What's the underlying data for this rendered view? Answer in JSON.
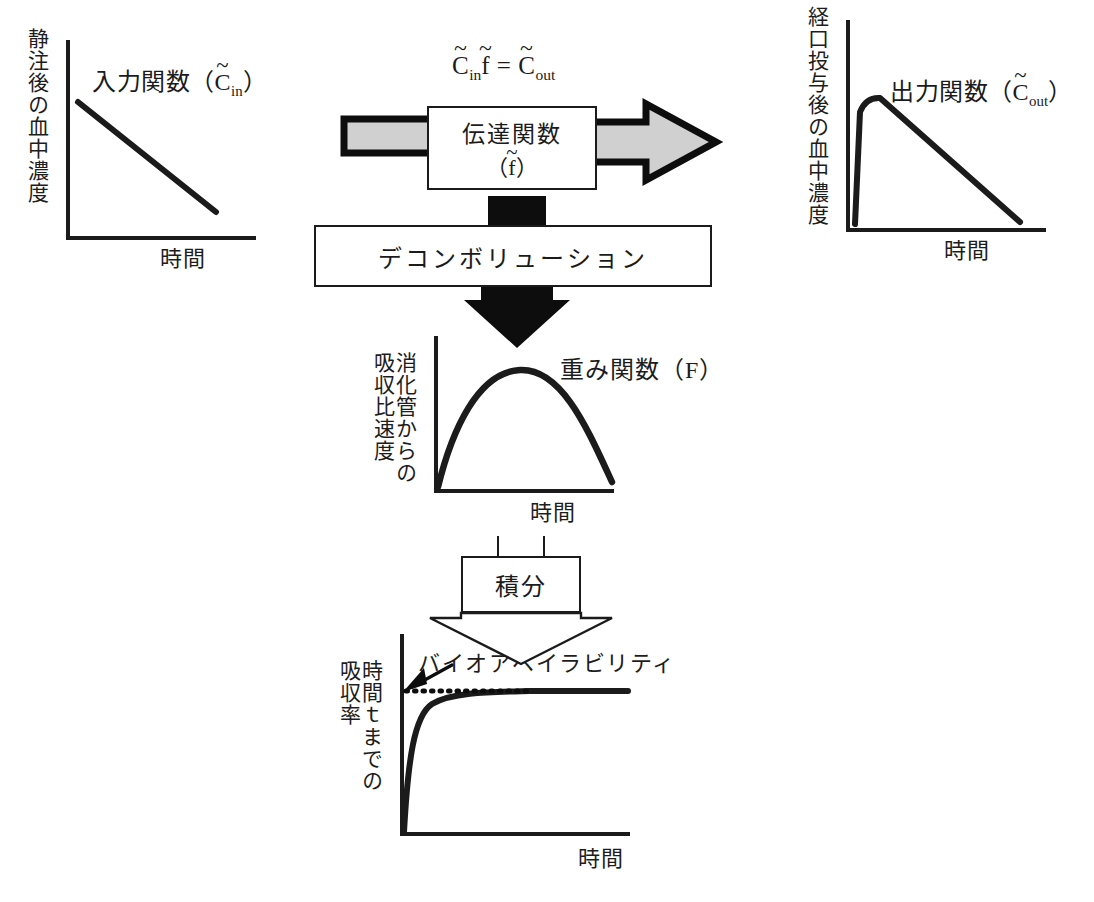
{
  "diagram": {
    "colors": {
      "line": "#1b1b1b",
      "arrow_fill": "#d0d0d0",
      "arrow_outline": "#0d0d0d",
      "block_fill": "#0d0d0d",
      "background": "#ffffff"
    }
  },
  "charts": {
    "input_function": {
      "ylabel": "静注後の血中濃度",
      "xlabel": "時間",
      "title": "入力関数（C̃in）",
      "title_parts": {
        "prefix": "入力関数（",
        "tilde": "~",
        "base": "C",
        "sub": "in",
        "suffix": "）"
      },
      "curve_type": "linear-decay"
    },
    "output_function": {
      "ylabel": "経口投与後の血中濃度",
      "xlabel": "時間",
      "title": "出力関数（C̃out）",
      "title_parts": {
        "prefix": "出力関数（",
        "tilde": "~",
        "base": "C",
        "sub": "out",
        "suffix": "）"
      },
      "curve_type": "rapid-rise-linear-decay"
    },
    "weight_function": {
      "ylabel_col1": "消化管からの",
      "ylabel_col2": "吸収比速度",
      "xlabel": "時間",
      "title": "重み関数（F）",
      "curve_type": "parabolic-peak"
    },
    "absorption_rate": {
      "ylabel_col1": "時間ｔまでの",
      "ylabel_col2": "吸収率",
      "xlabel": "時間",
      "annotation": "バイオアベイラビリティ",
      "curve_type": "saturating-plateau",
      "asymptote_style": "dotted"
    }
  },
  "boxes": {
    "transfer_function": {
      "line1": "伝達関数",
      "line2": "（f̃）",
      "line2_parts": {
        "prefix": "（",
        "tilde": "~",
        "base": "f",
        "suffix": "）"
      }
    },
    "deconvolution": {
      "label": "デコンボリューション"
    },
    "integration": {
      "label": "積分"
    }
  },
  "equation": {
    "text": "C̃inf̃ = C̃out",
    "lhs": {
      "tilde": "~",
      "base": "C",
      "sub": "in"
    },
    "lhs2": {
      "tilde": "~",
      "base": "f"
    },
    "operator": "=",
    "rhs": {
      "tilde": "~",
      "base": "C",
      "sub": "out"
    }
  },
  "arrows": {
    "input_to_transfer": "gray-block-arrow-right",
    "transfer_to_output": "gray-arrow-right",
    "transfer_to_deconvolution": "black-connector-block",
    "deconvolution_to_weight": "black-arrow-down",
    "weight_to_integration": "black-connector-block",
    "integration_to_absorption": "hollow-arrow-down",
    "bioavailability_pointer": "thin-arrow-down-left"
  }
}
